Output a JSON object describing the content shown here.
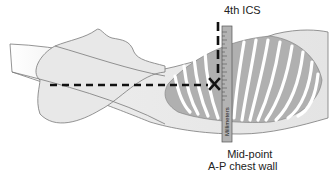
{
  "figure": {
    "type": "anatomical-diagram",
    "labels": {
      "top": "4th ICS",
      "ruler": "Millimeters",
      "bottom_line1": "Mid-point",
      "bottom_line2": "A-P chest wall"
    },
    "markers": {
      "intersection": "X"
    },
    "colors": {
      "body_fill": "#e6e6e6",
      "body_outline": "#7a7a7a",
      "rib_fill": "#ffffff",
      "lung_shade": "#a9a9a9",
      "ruler_fill": "#b3b3b3",
      "dash_line": "#111111",
      "text": "#222222"
    }
  }
}
